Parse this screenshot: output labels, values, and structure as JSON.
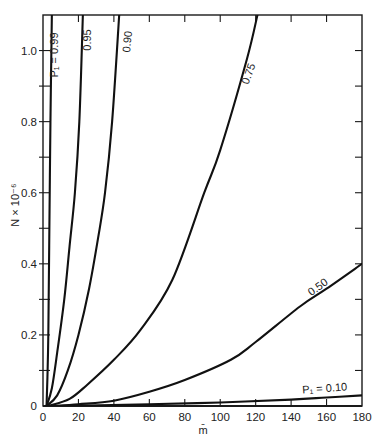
{
  "chart_data": {
    "type": "line",
    "title": "",
    "xlabel": "m̄",
    "ylabel": "N × 10⁻⁶",
    "xlim": [
      0,
      180
    ],
    "ylim": [
      0,
      1.1
    ],
    "grid": false,
    "legend": "inline curve labels",
    "x_ticks": [
      0,
      20,
      40,
      60,
      80,
      100,
      120,
      140,
      160,
      180
    ],
    "x_tick_labels": [
      "0",
      "20",
      "40",
      "60",
      "80",
      "100",
      "120",
      "140",
      "160",
      "180"
    ],
    "y_ticks": [
      0,
      0.2,
      0.4,
      0.6,
      0.8,
      1.0
    ],
    "y_tick_labels": [
      "0",
      "0.2",
      "0.4",
      "0.6",
      "0.8",
      "1.0"
    ],
    "y_minor_ticks": [
      0.1,
      0.3,
      0.5,
      0.7,
      0.9
    ],
    "series": [
      {
        "name": "P1 = 0.99",
        "label": "P₁ = 0.99",
        "label_pos": [
          58,
          55
        ],
        "label_rot": -90,
        "points": [
          [
            2,
            0
          ],
          [
            2.5,
            0.08
          ],
          [
            3,
            0.2
          ],
          [
            3.5,
            0.45
          ],
          [
            4.2,
            0.8
          ],
          [
            5,
            1.1
          ]
        ]
      },
      {
        "name": "0.95",
        "label": "0.95",
        "label_pos": [
          91,
          40
        ],
        "label_rot": -90,
        "points": [
          [
            2,
            0
          ],
          [
            5,
            0.05
          ],
          [
            8,
            0.15
          ],
          [
            12,
            0.3
          ],
          [
            15,
            0.45
          ],
          [
            18,
            0.6
          ],
          [
            20.5,
            0.8
          ],
          [
            22.5,
            1.1
          ]
        ]
      },
      {
        "name": "0.90",
        "label": "0.90",
        "label_pos": [
          131,
          42
        ],
        "label_rot": -84,
        "points": [
          [
            2,
            0
          ],
          [
            8,
            0.03
          ],
          [
            14,
            0.1
          ],
          [
            20,
            0.2
          ],
          [
            26,
            0.33
          ],
          [
            31,
            0.47
          ],
          [
            35,
            0.6
          ],
          [
            39,
            0.8
          ],
          [
            43,
            1.1
          ]
        ]
      },
      {
        "name": "0.75",
        "label": "0.75",
        "label_pos": [
          252,
          75
        ],
        "label_rot": -70,
        "points": [
          [
            3,
            0
          ],
          [
            15,
            0.02
          ],
          [
            25,
            0.06
          ],
          [
            40,
            0.13
          ],
          [
            55,
            0.214
          ],
          [
            73,
            0.355
          ],
          [
            91,
            0.6
          ],
          [
            100,
            0.72
          ],
          [
            115,
            0.975
          ],
          [
            121,
            1.1
          ]
        ]
      },
      {
        "name": "0.50",
        "label": "0.50",
        "label_pos": [
          320,
          290
        ],
        "label_rot": -36,
        "points": [
          [
            5,
            0
          ],
          [
            20,
            0.005
          ],
          [
            40,
            0.015
          ],
          [
            60,
            0.04
          ],
          [
            80,
            0.073
          ],
          [
            106,
            0.13
          ],
          [
            120,
            0.18
          ],
          [
            145,
            0.28
          ],
          [
            160,
            0.33
          ],
          [
            180,
            0.4
          ]
        ]
      },
      {
        "name": "P1 = 0.10",
        "label": "P₁ = 0.10",
        "label_pos": [
          325,
          392
        ],
        "label_rot": -4,
        "points": [
          [
            10,
            0
          ],
          [
            60,
            0.005
          ],
          [
            100,
            0.01
          ],
          [
            140,
            0.018
          ],
          [
            160,
            0.024
          ],
          [
            180,
            0.03
          ]
        ]
      }
    ]
  },
  "plot_area": {
    "left": 43,
    "right": 362,
    "top": 15,
    "bottom": 406
  }
}
